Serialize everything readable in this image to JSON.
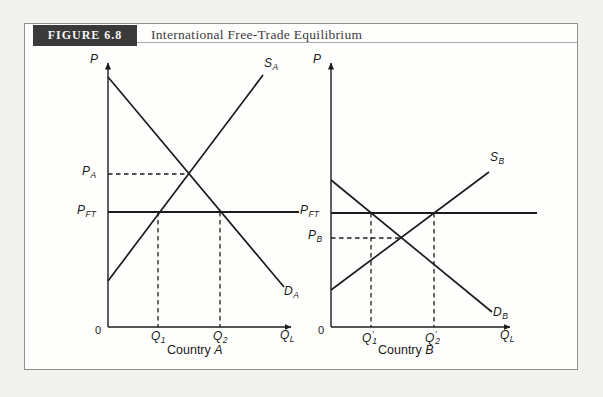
{
  "figure": {
    "label": "FIGURE 6.8",
    "title": "International Free-Trade Equilibrium"
  },
  "colors": {
    "page_bg": "#f1f1ee",
    "panel_bg": "#fefefd",
    "panel_border": "#8f8f8f",
    "header_bg": "#3a3a3a",
    "header_text": "#f5f5f5",
    "title_text": "#3d3d3d",
    "rule": "#aaaaaa",
    "line": "#1c1c1c",
    "label_text": "#1a1a1a"
  },
  "chart_data": [
    {
      "type": "line",
      "id": "country-a",
      "caption": "Country A",
      "ylabel": "P",
      "xlabel": "QL",
      "note": "qualitative supply-demand diagram, no numeric scale; autarky price PA lies above free-trade price PFT so Country A imports Q2 - Q1",
      "axes": {
        "origin_x": 108,
        "origin_y": 327,
        "y_top": 63,
        "x_right": 291
      },
      "series": [
        {
          "name": "supply-curve",
          "label": "SA",
          "x1": 108,
          "y1": 281,
          "x2": 263,
          "y2": 75
        },
        {
          "name": "demand-curve",
          "label": "DA",
          "x1": 108,
          "y1": 77,
          "x2": 284,
          "y2": 287
        }
      ],
      "guides": [
        {
          "name": "free-trade-price-line",
          "label": "PFT",
          "style": "solid",
          "x1": 108,
          "y1": 212,
          "x2": 299,
          "y2": 212
        },
        {
          "name": "autarky-price-line",
          "label": "PA",
          "style": "dashed",
          "x1": 108,
          "y1": 174,
          "x2": 189,
          "y2": 174
        },
        {
          "name": "quantity-supplied-line",
          "label": "Q1",
          "style": "dashed",
          "x1": 158,
          "y1": 212,
          "x2": 158,
          "y2": 327
        },
        {
          "name": "quantity-demanded-line",
          "label": "Q2",
          "style": "dashed",
          "x1": 220,
          "y1": 212,
          "x2": 220,
          "y2": 327
        }
      ],
      "labels": [
        {
          "id": "price-axis-label-a",
          "x": 90,
          "y": 53,
          "base": "P"
        },
        {
          "id": "origin-label-a",
          "x": 95,
          "y": 324,
          "base": "0",
          "italic": false,
          "cls": "zero"
        },
        {
          "id": "supply-label-a",
          "x": 264,
          "y": 57,
          "base": "S",
          "sub": "A"
        },
        {
          "id": "demand-label-a",
          "x": 284,
          "y": 285,
          "base": "D",
          "sub": "A"
        },
        {
          "id": "autarky-price-label-a",
          "x": 82,
          "y": 165,
          "base": "P",
          "sub": "A"
        },
        {
          "id": "free-trade-price-label-a",
          "x": 77,
          "y": 204,
          "base": "P",
          "sub": "FT"
        },
        {
          "id": "q1-label-a",
          "x": 151,
          "y": 330,
          "base": "Q",
          "sub": "1"
        },
        {
          "id": "q2-label-a",
          "x": 213,
          "y": 330,
          "base": "Q",
          "sub": "2"
        },
        {
          "id": "quantity-axis-label-a",
          "x": 280,
          "y": 329,
          "base": "Q",
          "sub": "L"
        },
        {
          "id": "caption-a",
          "x": 167,
          "y": 344,
          "roman": "Country",
          "italic_part": "A",
          "cls": "caption"
        }
      ]
    },
    {
      "type": "line",
      "id": "country-b",
      "caption": "Country B",
      "ylabel": "P",
      "xlabel": "QL",
      "note": "autarky price PB lies below free-trade price PFT so Country B exports Q'2 - Q'1",
      "axes": {
        "origin_x": 331,
        "origin_y": 327,
        "y_top": 63,
        "x_right": 510
      },
      "series": [
        {
          "name": "supply-curve",
          "label": "SB",
          "x1": 331,
          "y1": 290,
          "x2": 489,
          "y2": 172
        },
        {
          "name": "demand-curve",
          "label": "DB",
          "x1": 331,
          "y1": 180,
          "x2": 492,
          "y2": 312
        }
      ],
      "guides": [
        {
          "name": "free-trade-price-line",
          "label": "PFT",
          "style": "solid",
          "x1": 331,
          "y1": 213,
          "x2": 537,
          "y2": 213
        },
        {
          "name": "autarky-price-line",
          "label": "PB",
          "style": "dashed",
          "x1": 331,
          "y1": 238,
          "x2": 403,
          "y2": 238
        },
        {
          "name": "quantity-demanded-line",
          "label": "Q'1",
          "style": "dashed",
          "x1": 371,
          "y1": 213,
          "x2": 371,
          "y2": 327
        },
        {
          "name": "quantity-supplied-line",
          "label": "Q'2",
          "style": "dashed",
          "x1": 434,
          "y1": 213,
          "x2": 434,
          "y2": 327
        }
      ],
      "labels": [
        {
          "id": "price-axis-label-b",
          "x": 313,
          "y": 53,
          "base": "P"
        },
        {
          "id": "origin-label-b",
          "x": 318,
          "y": 324,
          "base": "0",
          "italic": false,
          "cls": "zero"
        },
        {
          "id": "supply-label-b",
          "x": 490,
          "y": 151,
          "base": "S",
          "sub": "B"
        },
        {
          "id": "demand-label-b",
          "x": 493,
          "y": 306,
          "base": "D",
          "sub": "B"
        },
        {
          "id": "autarky-price-label-b",
          "x": 308,
          "y": 229,
          "base": "P",
          "sub": "B"
        },
        {
          "id": "free-trade-price-label-b",
          "x": 300,
          "y": 204,
          "base": "P",
          "sub": "FT"
        },
        {
          "id": "q1-label-b",
          "x": 362,
          "y": 330,
          "base": "Q",
          "prime": "′",
          "sub": "1"
        },
        {
          "id": "q2-label-b",
          "x": 425,
          "y": 330,
          "base": "Q",
          "prime": "′",
          "sub": "2"
        },
        {
          "id": "quantity-axis-label-b",
          "x": 500,
          "y": 329,
          "base": "Q",
          "sub": "L"
        },
        {
          "id": "caption-b",
          "x": 378,
          "y": 344,
          "roman": "Country",
          "italic_part": "B",
          "cls": "caption"
        }
      ]
    }
  ]
}
